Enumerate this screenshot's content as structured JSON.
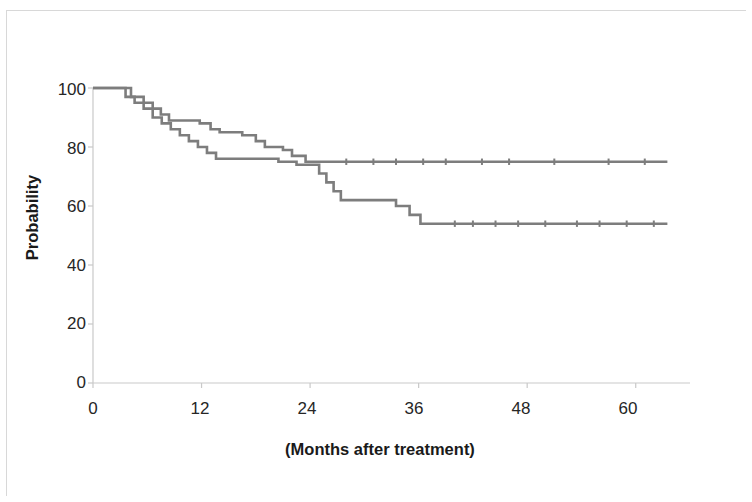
{
  "chart_data": {
    "type": "line",
    "title": "",
    "subtitle": "",
    "xlabel": "(Months after treatment)",
    "ylabel": "Probability",
    "xlim": [
      0,
      66
    ],
    "ylim": [
      0,
      100
    ],
    "xticks": [
      0,
      12,
      24,
      36,
      48,
      60
    ],
    "xtick_labels": [
      "0",
      "12",
      "24",
      "36",
      "48",
      "60"
    ],
    "yticks": [
      0,
      20,
      40,
      60,
      80,
      100
    ],
    "ytick_labels": [
      "0",
      "20",
      "40",
      "60",
      "80",
      "100"
    ],
    "grid": false,
    "legend": "none",
    "line_color": "#7d7d7d",
    "axis_color": "#bfbfbf",
    "step_style": "post",
    "series": [
      {
        "name": "upper-curve",
        "note": "Kaplan-Meier curve plateauing near 75%",
        "points": [
          [
            0,
            100
          ],
          [
            4.2,
            100
          ],
          [
            4.2,
            97
          ],
          [
            5.6,
            97
          ],
          [
            5.6,
            95
          ],
          [
            6.6,
            95
          ],
          [
            6.6,
            93
          ],
          [
            7.5,
            93
          ],
          [
            7.5,
            91
          ],
          [
            8.4,
            91
          ],
          [
            8.4,
            89
          ],
          [
            11.8,
            89
          ],
          [
            11.8,
            88
          ],
          [
            13.0,
            88
          ],
          [
            13.0,
            86
          ],
          [
            14.0,
            86
          ],
          [
            14.0,
            85
          ],
          [
            16.5,
            85
          ],
          [
            16.5,
            84
          ],
          [
            18.0,
            84
          ],
          [
            18.0,
            82
          ],
          [
            19.0,
            82
          ],
          [
            19.0,
            80
          ],
          [
            21.0,
            80
          ],
          [
            21.0,
            79
          ],
          [
            22.0,
            79
          ],
          [
            22.0,
            77
          ],
          [
            23.5,
            77
          ],
          [
            23.5,
            75
          ],
          [
            24.6,
            75
          ],
          [
            63.5,
            75
          ]
        ],
        "censor_marks": [
          28.0,
          31.0,
          33.5,
          36.5,
          39.0,
          43.0,
          46.0,
          51.0,
          57.0,
          61.0
        ]
      },
      {
        "name": "lower-curve",
        "note": "Kaplan-Meier curve plateauing near 54%",
        "points": [
          [
            0,
            100
          ],
          [
            3.6,
            100
          ],
          [
            3.6,
            97
          ],
          [
            4.6,
            97
          ],
          [
            4.6,
            95
          ],
          [
            5.6,
            95
          ],
          [
            5.6,
            93
          ],
          [
            6.6,
            93
          ],
          [
            6.6,
            90
          ],
          [
            7.6,
            90
          ],
          [
            7.6,
            88
          ],
          [
            8.6,
            88
          ],
          [
            8.6,
            86
          ],
          [
            9.6,
            86
          ],
          [
            9.6,
            84
          ],
          [
            10.6,
            84
          ],
          [
            10.6,
            82
          ],
          [
            11.6,
            82
          ],
          [
            11.6,
            80
          ],
          [
            12.6,
            80
          ],
          [
            12.6,
            78
          ],
          [
            13.6,
            78
          ],
          [
            13.6,
            76
          ],
          [
            14.6,
            76
          ],
          [
            20.5,
            76
          ],
          [
            20.5,
            75
          ],
          [
            22.5,
            75
          ],
          [
            22.5,
            74
          ],
          [
            25.0,
            74
          ],
          [
            25.0,
            71
          ],
          [
            25.8,
            71
          ],
          [
            25.8,
            68
          ],
          [
            26.6,
            68
          ],
          [
            26.6,
            65
          ],
          [
            27.4,
            65
          ],
          [
            27.4,
            62
          ],
          [
            33.5,
            62
          ],
          [
            33.5,
            60
          ],
          [
            35.0,
            60
          ],
          [
            35.0,
            57
          ],
          [
            36.2,
            57
          ],
          [
            36.2,
            54
          ],
          [
            63.5,
            54
          ]
        ],
        "censor_marks": [
          40.0,
          42.0,
          44.5,
          47.0,
          50.0,
          53.5,
          56.0,
          59.0,
          62.0
        ]
      }
    ]
  },
  "axes": {
    "y_title": "Probability",
    "x_title": "(Months after treatment)",
    "y_labels": [
      "100",
      "80",
      "60",
      "40",
      "20",
      "0"
    ],
    "x_labels": [
      "0",
      "12",
      "24",
      "36",
      "48",
      "60"
    ]
  }
}
